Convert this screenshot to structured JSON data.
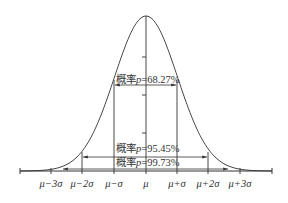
{
  "diagram": {
    "title": "",
    "type": "normal-distribution",
    "x_tick_labels": [
      "μ−3σ",
      "μ−2σ",
      "μ−σ",
      "μ",
      "μ+σ",
      "μ+2σ",
      "μ+3σ"
    ],
    "intervals": [
      {
        "range": "μ±σ",
        "prefix": "概率",
        "var": "p",
        "value": "=68.27%"
      },
      {
        "range": "μ±2σ",
        "prefix": "概率",
        "var": "p",
        "value": "=95.45%"
      },
      {
        "range": "μ±3σ",
        "prefix": "概率",
        "var": "p",
        "value": "=99.73%"
      }
    ],
    "colors": {
      "line": "#333333",
      "background": "#ffffff"
    }
  }
}
